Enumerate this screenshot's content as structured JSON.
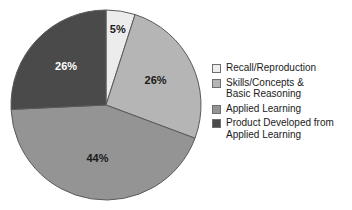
{
  "chart_data": {
    "type": "pie",
    "title": "",
    "categories": [
      "Recall/Reproduction",
      "Skills/Concepts & Basic Reasoning",
      "Applied Learning",
      "Product Developed from Applied Learning"
    ],
    "values": [
      5,
      26,
      44,
      26
    ],
    "value_labels": [
      "5%",
      "26%",
      "44%",
      "26%"
    ],
    "colors": [
      "#ececec",
      "#b5b5b5",
      "#949494",
      "#4a4a4a"
    ],
    "label_colors": [
      "#1a1a1a",
      "#1a1a1a",
      "#1a1a1a",
      "#ffffff"
    ],
    "start_angle_deg": 0,
    "direction": "clockwise",
    "legend_position": "right",
    "grid": false,
    "xlabel": "",
    "ylabel": ""
  },
  "legend": {
    "items": [
      {
        "label": "Recall/Reproduction",
        "color": "#ececec"
      },
      {
        "label": "Skills/Concepts &\nBasic Reasoning",
        "color": "#b5b5b5"
      },
      {
        "label": "Applied Learning",
        "color": "#949494"
      },
      {
        "label": "Product Developed from\nApplied Learning",
        "color": "#4a4a4a"
      }
    ]
  },
  "slice_labels": {
    "recall": "5%",
    "skills": "26%",
    "applied": "44%",
    "product": "26%"
  }
}
